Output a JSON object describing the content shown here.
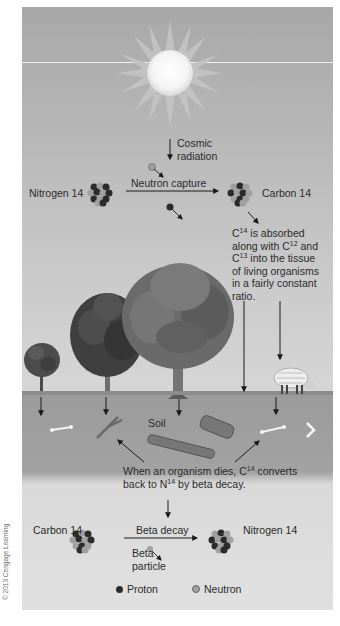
{
  "figure": {
    "colors": {
      "sky_top": "#a8a8a8",
      "sky_bottom": "#d6d6d6",
      "soil": "#9b9b9b",
      "lower_panel": "#e0e0e0",
      "proton": "#2b2b2b",
      "neutron": "#a0a0a0",
      "text": "#2a2a2a"
    },
    "sun": {
      "icon": "sun-icon"
    },
    "cosmic_radiation": {
      "label": "Cosmic radiation",
      "line1": "Cosmic",
      "line2": "radiation"
    },
    "formation": {
      "reactant": "Nitrogen 14",
      "process": "Neutron capture",
      "product": "Carbon 14"
    },
    "absorption_note": {
      "line1_pre": "C",
      "line1_sup": "14",
      "line1_post": " is absorbed",
      "line2_pre": "along with C",
      "line2_sup": "12",
      "line2_post": " and",
      "line3_pre": "C",
      "line3_sup": "13",
      "line3_post": " into the tissue",
      "line4": "of living organisms",
      "line5": "in a fairly constant",
      "line6": "ratio."
    },
    "soil_label": "Soil",
    "decay_note": {
      "line1_pre": "When an organism dies, C",
      "line1_sup": "14",
      "line1_post": " converts",
      "line2_pre": "back to N",
      "line2_sup": "14",
      "line2_post": " by beta decay."
    },
    "decay": {
      "reactant": "Carbon 14",
      "process": "Beta decay",
      "product": "Nitrogen 14",
      "emitted_line1": "Beta",
      "emitted_line2": "particle"
    },
    "legend": {
      "proton": "Proton",
      "neutron": "Neutron"
    },
    "copyright": "© 2013 Cengage Learning"
  }
}
